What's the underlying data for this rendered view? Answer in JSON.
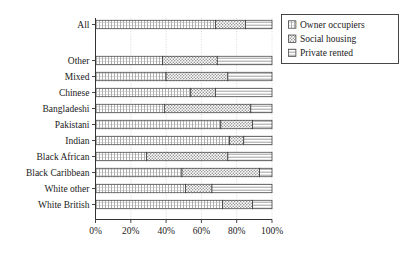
{
  "chart_data": {
    "type": "bar",
    "orientation": "horizontal",
    "stacked": true,
    "stack_mode": "percent",
    "title": "",
    "subtitle": "",
    "xlabel": "",
    "ylabel": "",
    "xlim": [
      0,
      100
    ],
    "xtick_labels": [
      "0%",
      "20%",
      "40%",
      "60%",
      "80%",
      "100%"
    ],
    "xticks": [
      0,
      20,
      40,
      60,
      80,
      100
    ],
    "grid": true,
    "grid_axis": "x",
    "legend_position": "top-right",
    "categories": [
      "All",
      "Other",
      "Mixed",
      "Chinese",
      "Bangladeshi",
      "Pakistani",
      "Indian",
      "Black African",
      "Black Caribbean",
      "White other",
      "White British"
    ],
    "series": [
      {
        "name": "Owner occupiers",
        "pattern": "grid-hatch",
        "values": [
          68,
          38,
          40,
          54,
          39,
          71,
          76,
          29,
          49,
          51,
          72
        ]
      },
      {
        "name": "Social housing",
        "pattern": "dotted-hatch",
        "values": [
          17,
          31,
          35,
          14,
          49,
          18,
          8,
          46,
          44,
          15,
          17
        ]
      },
      {
        "name": "Private rented",
        "pattern": "horizontal-lines",
        "values": [
          15,
          31,
          25,
          32,
          12,
          11,
          16,
          25,
          7,
          34,
          11
        ]
      }
    ],
    "legend": [
      {
        "label": "Owner occupiers",
        "pattern": "grid-hatch"
      },
      {
        "label": "Social housing",
        "pattern": "dotted-hatch"
      },
      {
        "label": "Private rented",
        "pattern": "horizontal-lines"
      }
    ],
    "colors": {
      "axis": "#333333",
      "grid": "#c9c9c9",
      "bar_outline": "#333333",
      "text": "#1a1a1a",
      "background": "#ffffff"
    }
  }
}
